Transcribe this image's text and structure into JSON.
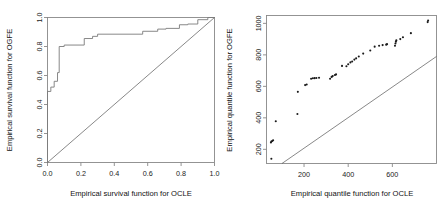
{
  "figure": {
    "panels": [
      {
        "id": "left",
        "name": "empirical-survival-plot",
        "xlabel": "Empirical survival function for OCLE",
        "ylabel": "Empirical survival function for OGFE",
        "xticks": [
          "0.0",
          "0.2",
          "0.4",
          "0.6",
          "0.8",
          "1.0"
        ],
        "yticks": [
          "0.0",
          "0.2",
          "0.4",
          "0.6",
          "0.8",
          "1.0"
        ]
      },
      {
        "id": "right",
        "name": "empirical-quantile-plot",
        "xlabel": "Empirical quantile function for OCLE",
        "ylabel": "Empirical quantile function for OGFE",
        "xticks": [
          "200",
          "400",
          "600"
        ],
        "yticks": [
          "200",
          "400",
          "600",
          "800",
          "1000"
        ]
      }
    ]
  },
  "chart_data": [
    {
      "type": "line",
      "id": "left",
      "title": "",
      "xlabel": "Empirical survival function for OCLE",
      "ylabel": "Empirical survival function for OGFE",
      "xlim": [
        0.0,
        1.0
      ],
      "ylim": [
        0.0,
        1.0
      ],
      "xticks": [
        0.0,
        0.2,
        0.4,
        0.6,
        0.8,
        1.0
      ],
      "yticks": [
        0.0,
        0.2,
        0.4,
        0.6,
        0.8,
        1.0
      ],
      "grid": false,
      "legend": null,
      "series": [
        {
          "name": "empirical survival step curve",
          "drawstyle": "steps-post",
          "color": "#7a7a7a",
          "x": [
            0.0,
            0.0,
            0.02,
            0.02,
            0.04,
            0.04,
            0.06,
            0.06,
            0.07,
            0.07,
            0.1,
            0.1,
            0.22,
            0.22,
            0.27,
            0.27,
            0.3,
            0.3,
            0.5,
            0.5,
            0.57,
            0.57,
            0.66,
            0.66,
            0.71,
            0.71,
            0.79,
            0.79,
            0.84,
            0.84,
            0.9,
            0.9,
            0.96,
            0.96,
            1.0
          ],
          "y": [
            0.0,
            0.49,
            0.49,
            0.52,
            0.52,
            0.56,
            0.56,
            0.62,
            0.62,
            0.8,
            0.8,
            0.81,
            0.81,
            0.855,
            0.855,
            0.87,
            0.87,
            0.885,
            0.885,
            0.885,
            0.885,
            0.905,
            0.905,
            0.92,
            0.92,
            0.925,
            0.925,
            0.95,
            0.95,
            0.955,
            0.955,
            0.985,
            0.985,
            1.0,
            1.0
          ]
        },
        {
          "name": "reference diagonal y = x",
          "drawstyle": "line",
          "color": "#555555",
          "x": [
            0.0,
            1.0
          ],
          "y": [
            0.0,
            1.0
          ]
        }
      ]
    },
    {
      "type": "scatter",
      "id": "right",
      "title": "",
      "xlabel": "Empirical quantile function for OCLE",
      "ylabel": "Empirical quantile function for OGFE",
      "xlim": [
        30,
        800
      ],
      "ylim": [
        110,
        1050
      ],
      "xticks": [
        200,
        400,
        600
      ],
      "yticks": [
        200,
        400,
        600,
        800,
        1000
      ],
      "grid": false,
      "legend": null,
      "marker": "point",
      "points": [
        [
          52,
          140
        ],
        [
          50,
          243
        ],
        [
          52,
          250
        ],
        [
          56,
          253
        ],
        [
          60,
          258
        ],
        [
          72,
          378
        ],
        [
          170,
          424
        ],
        [
          172,
          565
        ],
        [
          205,
          608
        ],
        [
          212,
          612
        ],
        [
          232,
          648
        ],
        [
          240,
          651
        ],
        [
          248,
          652
        ],
        [
          256,
          653
        ],
        [
          268,
          655
        ],
        [
          318,
          648
        ],
        [
          325,
          660
        ],
        [
          330,
          665
        ],
        [
          340,
          672
        ],
        [
          345,
          676
        ],
        [
          372,
          730
        ],
        [
          392,
          728
        ],
        [
          400,
          740
        ],
        [
          410,
          752
        ],
        [
          418,
          758
        ],
        [
          428,
          770
        ],
        [
          436,
          778
        ],
        [
          448,
          790
        ],
        [
          468,
          808
        ],
        [
          500,
          828
        ],
        [
          520,
          852
        ],
        [
          540,
          858
        ],
        [
          556,
          862
        ],
        [
          572,
          865
        ],
        [
          576,
          868
        ],
        [
          612,
          858
        ],
        [
          614,
          872
        ],
        [
          616,
          884
        ],
        [
          618,
          892
        ],
        [
          636,
          900
        ],
        [
          648,
          912
        ],
        [
          684,
          938
        ],
        [
          760,
          1008
        ],
        [
          762,
          1018
        ]
      ],
      "series": [
        {
          "name": "reference line",
          "drawstyle": "line",
          "color": "#555555",
          "x": [
            100,
            800
          ],
          "y": [
            110,
            790
          ]
        }
      ]
    }
  ]
}
